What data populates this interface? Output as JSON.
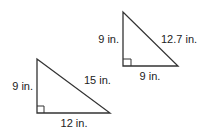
{
  "triangles": [
    {
      "id": "small",
      "legs": {
        "vertical": "9 in.",
        "horizontal": "12 in."
      },
      "hypotenuse": "15 in.",
      "vertices": {
        "top": [
          37,
          59
        ],
        "corner": [
          37,
          113
        ],
        "right": [
          110,
          113
        ]
      }
    },
    {
      "id": "top",
      "legs": {
        "vertical": "9 in.",
        "horizontal": "9 in."
      },
      "hypotenuse": "12.7 in.",
      "vertices": {
        "top": [
          123,
          12
        ],
        "corner": [
          123,
          66
        ],
        "right": [
          178,
          66
        ]
      }
    }
  ],
  "colors": {
    "stroke": "#333333",
    "text": "#222222",
    "background": "#ffffff"
  }
}
